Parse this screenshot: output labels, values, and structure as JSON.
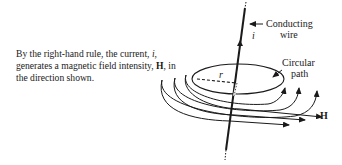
{
  "caption": {
    "part1": "By the right-hand rule, the current, ",
    "current_symbol": "i",
    "part2": ", generates a magnetic field intensity, ",
    "field_symbol": "H",
    "part3": ", in the direction shown."
  },
  "labels": {
    "wire_line1": "Conducting",
    "wire_line2": "wire",
    "current": "i",
    "radius": "r",
    "path_line1": "Circular",
    "path_line2": "path",
    "field": "H"
  }
}
